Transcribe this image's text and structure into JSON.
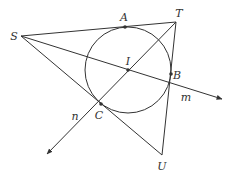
{
  "diagram": {
    "colors": {
      "stroke": "#333333",
      "background": "#ffffff",
      "label": "#333333"
    },
    "points": {
      "S": {
        "label": "S",
        "x": 21,
        "y": 36,
        "lx": 14,
        "ly": 36
      },
      "T": {
        "label": "T",
        "x": 176,
        "y": 22,
        "lx": 179,
        "ly": 12
      },
      "U": {
        "label": "U",
        "x": 162,
        "y": 155,
        "lx": 162,
        "ly": 166
      },
      "A": {
        "label": "A",
        "x": 125,
        "y": 27,
        "lx": 124,
        "ly": 17
      },
      "B": {
        "label": "B",
        "x": 171,
        "y": 74,
        "lx": 177,
        "ly": 75
      },
      "C": {
        "label": "C",
        "x": 101,
        "y": 104,
        "lx": 99,
        "ly": 115
      },
      "I": {
        "label": "I",
        "x": 128,
        "y": 71,
        "lx": 128,
        "ly": 62
      }
    },
    "circle": {
      "cx": 128,
      "cy": 70,
      "r": 43
    },
    "lines": {
      "m": {
        "label": "m",
        "lx": 186,
        "ly": 97
      },
      "n": {
        "label": "n",
        "lx": 75,
        "ly": 116
      }
    }
  }
}
